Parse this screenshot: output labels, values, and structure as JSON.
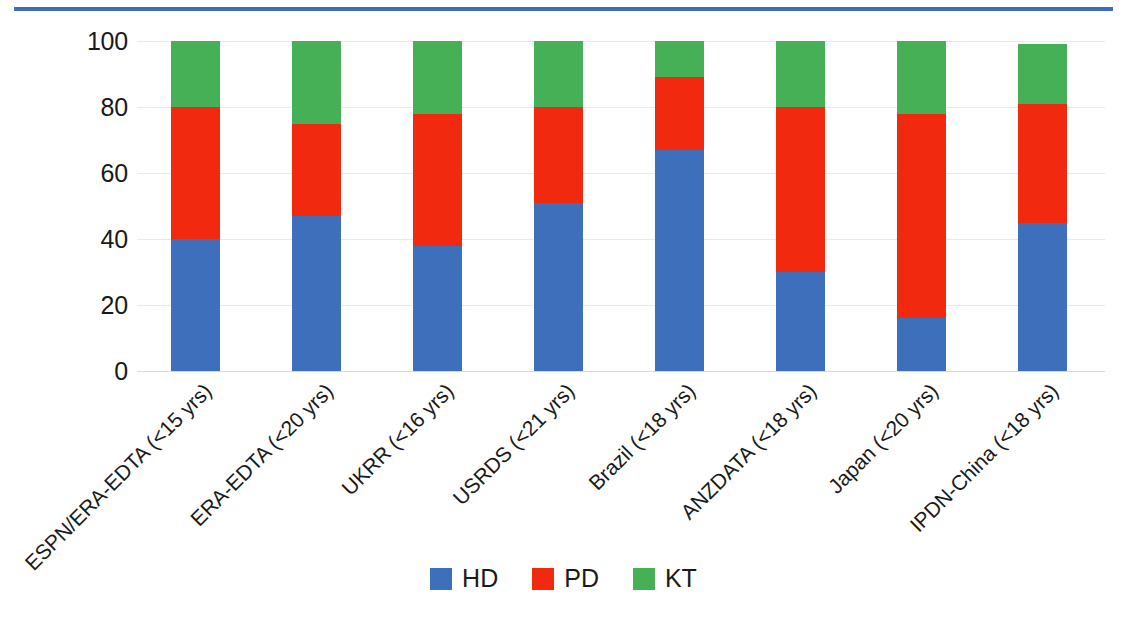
{
  "chart_data": {
    "type": "bar",
    "subtype": "stacked-bar-100-percent",
    "title": "",
    "subtitle": "",
    "xlabel": "",
    "ylabel": "",
    "ylim": [
      0,
      100
    ],
    "yticks": [
      0,
      20,
      40,
      60,
      80,
      100
    ],
    "ytick_labels": [
      "0",
      "20",
      "40",
      "60",
      "80",
      "100"
    ],
    "grid": true,
    "grid_axis": "y",
    "legend_position": "bottom-center",
    "categories": [
      "ESPN/ERA-EDTA (<15 yrs)",
      "ERA-EDTA (<20 yrs)",
      "UKRR (<16 yrs)",
      "USRDS (<21 yrs)",
      "Brazil (<18 yrs)",
      "ANZDATA (<18 yrs)",
      "Japan (<20 yrs)",
      "IPDN-China (<18 yrs)"
    ],
    "series": [
      {
        "name": "HD",
        "color": "#3d6fbb",
        "values": [
          40,
          47,
          38,
          51,
          67,
          30,
          16,
          45
        ]
      },
      {
        "name": "PD",
        "color": "#f0290f",
        "values": [
          40,
          28,
          40,
          29,
          22,
          50,
          62,
          36
        ]
      },
      {
        "name": "KT",
        "color": "#45b055",
        "values": [
          20,
          25,
          22,
          20,
          11,
          20,
          22,
          18
        ]
      }
    ],
    "cumulative_tops": [
      [
        40,
        80,
        100
      ],
      [
        47,
        75,
        100
      ],
      [
        38,
        78,
        100
      ],
      [
        51,
        80,
        100
      ],
      [
        67,
        89,
        100
      ],
      [
        30,
        80,
        100
      ],
      [
        16,
        78,
        100
      ],
      [
        45,
        81,
        99
      ]
    ],
    "legend": [
      {
        "label": "HD",
        "color": "#3d6fbb"
      },
      {
        "label": "PD",
        "color": "#f0290f"
      },
      {
        "label": "KT",
        "color": "#45b055"
      }
    ]
  },
  "decor": {
    "top_rule_color": "#3f6fbb"
  }
}
